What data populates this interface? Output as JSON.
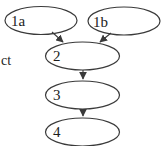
{
  "diagram": {
    "type": "flowchart",
    "background_color": "#ffffff",
    "stroke_color": "#3a3a3a",
    "text_color": "#1c1c1c",
    "side_text": "ct",
    "nodes": [
      {
        "id": "1a",
        "label": "1a",
        "shape": "ellipse"
      },
      {
        "id": "1b",
        "label": "1b",
        "shape": "ellipse"
      },
      {
        "id": "2",
        "label": "2",
        "shape": "ellipse"
      },
      {
        "id": "3",
        "label": "3",
        "shape": "ellipse"
      },
      {
        "id": "4",
        "label": "4",
        "shape": "ellipse"
      }
    ],
    "edges": [
      {
        "from": "1a",
        "to": "2"
      },
      {
        "from": "1b",
        "to": "2"
      },
      {
        "from": "2",
        "to": "3"
      },
      {
        "from": "3",
        "to": "4"
      }
    ]
  }
}
